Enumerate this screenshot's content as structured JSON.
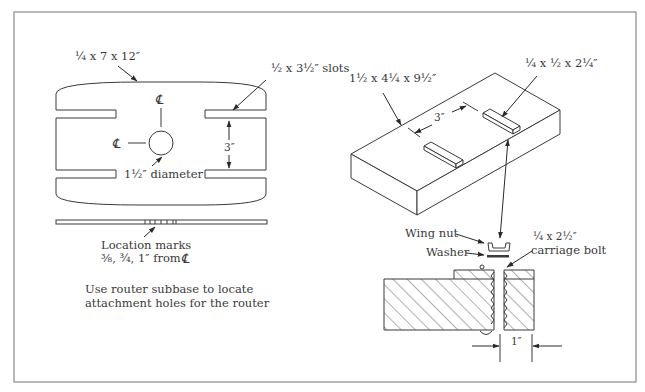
{
  "figure": {
    "left_view": {
      "board_label": "1/4 x 7 x 12″",
      "board_label_parts": {
        "frac": "¼",
        "rest": " x 7 x 12″"
      },
      "slots_label": "½ x 3½″ slots",
      "slot_spacing": "3″",
      "hole_label": "1½″ diameter",
      "centerline_symbol": "℄",
      "location_marks_title": "Location marks",
      "location_marks_values": "⅜, ¾, 1″ from",
      "note_line1": "Use router subbase to locate",
      "note_line2": "attachment holes for the router"
    },
    "right_view": {
      "base_label": "1½ x 4¼ x 9½″",
      "runner_label": "¼ x ½ x 2¼″",
      "runner_spacing": "3″",
      "wing_nut_label": "Wing nut",
      "washer_label": "Washer",
      "bolt_label_line1": "¼ x 2½″",
      "bolt_label_line2": "carriage bolt",
      "gap_dimension": "1″"
    }
  }
}
